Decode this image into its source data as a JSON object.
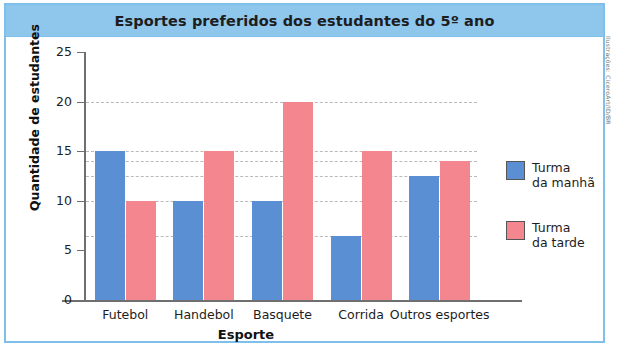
{
  "figure": {
    "title": "Esportes preferidos dos estudantes do 5º ano",
    "credit": "Ilustrações: CiceroArt/ID/BR",
    "banner_color": "#8FC6EC",
    "border_color": "#7FC0EA"
  },
  "legend": {
    "items": [
      {
        "label": "Turma\nda manhã",
        "color": "#5B8FD4",
        "name": "turma-da-manha"
      },
      {
        "label": "Turma\nda tarde",
        "color": "#F4868F",
        "name": "turma-da-tarde"
      }
    ]
  },
  "chart_data": {
    "type": "bar",
    "title": "Esportes preferidos dos estudantes do 5º ano",
    "xlabel": "Esporte",
    "ylabel": "Quantidade de estudantes",
    "categories": [
      "Futebol",
      "Handebol",
      "Basquete",
      "Corrida",
      "Outros esportes"
    ],
    "series": [
      {
        "name": "Turma da manhã",
        "color": "#5B8FD4",
        "values": [
          15,
          10,
          10,
          6.5,
          12.5
        ]
      },
      {
        "name": "Turma da tarde",
        "color": "#F4868F",
        "values": [
          10,
          15,
          20,
          15,
          14
        ]
      }
    ],
    "ylim": [
      0,
      25
    ],
    "yticks": [
      0,
      5,
      10,
      15,
      20,
      25
    ],
    "ytick_labels": [
      "0",
      "5",
      "10",
      "15",
      "20",
      "25"
    ],
    "gridlines": [
      6.5,
      10,
      12.5,
      14,
      15,
      20
    ],
    "grid": true,
    "legend_position": "right"
  }
}
